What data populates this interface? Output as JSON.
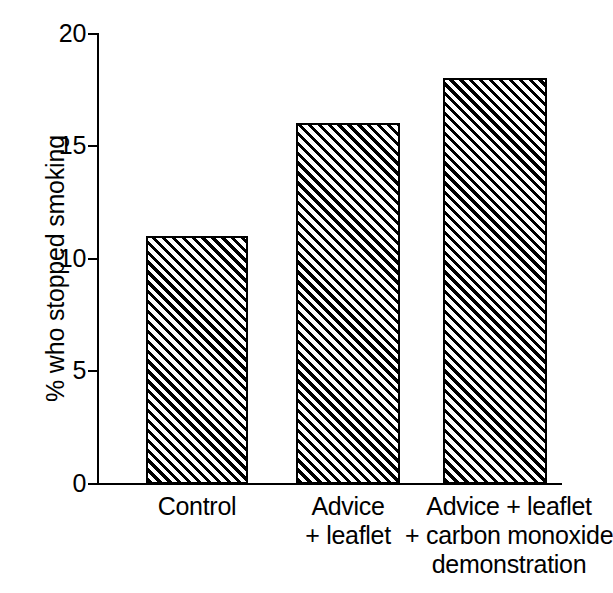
{
  "chart_data": {
    "type": "bar",
    "title": "",
    "subtitle": "",
    "xlabel": "",
    "ylabel": "% who stopped smoking",
    "categories": [
      "Control",
      "Advice + leaflet",
      "Advice + leaflet + carbon monoxide demonstration"
    ],
    "category_lines": [
      [
        "Control"
      ],
      [
        "Advice",
        "+ leaflet"
      ],
      [
        "Advice + leaflet",
        "+ carbon monoxide",
        "demonstration"
      ]
    ],
    "values": [
      11,
      16,
      18
    ],
    "ylim": [
      0,
      20
    ],
    "y_ticks": [
      0,
      5,
      10,
      15,
      20
    ],
    "y_tick_labels": [
      "0",
      "5",
      "10",
      "15",
      "20"
    ],
    "grid": false,
    "legend": false,
    "legend_position": "none",
    "bar_fill": "diagonal-hatch",
    "colors": {
      "axis": "#000000",
      "bar_outline": "#000000",
      "bar_hatch": "#000000",
      "bar_background": "#ffffff",
      "page_background": "#ffffff",
      "text": "#000000"
    }
  },
  "axis": {
    "y_title": "% who stopped smoking",
    "ticks": [
      {
        "label": "20",
        "value": 20
      },
      {
        "label": "15",
        "value": 15
      },
      {
        "label": "10",
        "value": 10
      },
      {
        "label": "5",
        "value": 5
      },
      {
        "label": "0",
        "value": 0
      }
    ]
  },
  "bars": [
    {
      "label": "Control",
      "value": 11,
      "lines": [
        "Control"
      ]
    },
    {
      "label": "Advice + leaflet",
      "value": 16,
      "lines": [
        "Advice",
        "+ leaflet"
      ]
    },
    {
      "label": "Advice + leaflet + carbon monoxide demonstration",
      "value": 18,
      "lines": [
        "Advice + leaflet",
        "+ carbon monoxide",
        "demonstration"
      ]
    }
  ]
}
